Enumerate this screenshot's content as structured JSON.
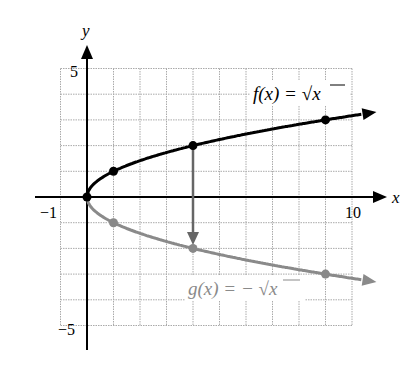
{
  "chart_data": {
    "type": "line",
    "title": "",
    "xlabel": "x",
    "ylabel": "y",
    "xlim": [
      -1,
      10
    ],
    "ylim": [
      -5,
      5
    ],
    "grid": true,
    "tick_labels": {
      "x": [
        "-1",
        "10"
      ],
      "y": [
        "5",
        "-5"
      ]
    },
    "series": [
      {
        "name": "f(x) = √x",
        "color": "#000000",
        "points": [
          [
            0,
            0
          ],
          [
            1,
            1
          ],
          [
            4,
            2
          ],
          [
            9,
            3
          ]
        ]
      },
      {
        "name": "g(x) = −√x",
        "color": "#888888",
        "points": [
          [
            0,
            0
          ],
          [
            1,
            -1
          ],
          [
            4,
            -2
          ],
          [
            9,
            -3
          ]
        ]
      }
    ],
    "annotations": [
      {
        "type": "arrow",
        "from": [
          4,
          2
        ],
        "to": [
          4,
          -2
        ],
        "color": "#666666",
        "description": "reflection across x-axis"
      }
    ]
  },
  "labels": {
    "x_axis": "x",
    "y_axis": "y",
    "x_min_tick": "−1",
    "x_max_tick": "10",
    "y_max_tick": "5",
    "y_min_tick": "−5",
    "f_label_prefix": "f(x) = ",
    "g_label_prefix": "g(x) = − ",
    "sqrt_arg": "x"
  }
}
